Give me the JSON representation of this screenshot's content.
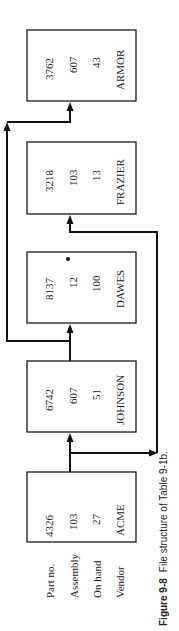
{
  "figure": {
    "caption_label": "Figure 9-8",
    "caption_text": "File structure of Table 9-1b.",
    "field_labels": [
      "Part no.",
      "Assembly",
      "On hand",
      "Vendor"
    ],
    "records": [
      {
        "part_no": "4326",
        "assembly": "103",
        "on_hand": "27",
        "vendor": "ACME"
      },
      {
        "part_no": "6742",
        "assembly": "607",
        "on_hand": "51",
        "vendor": "JOHNSON"
      },
      {
        "part_no": "8137",
        "assembly": "12",
        "on_hand": "100",
        "vendor": "DAWES",
        "marker": "•"
      },
      {
        "part_no": "3218",
        "assembly": "103",
        "on_hand": "13",
        "vendor": "FRAZIER"
      },
      {
        "part_no": "3762",
        "assembly": "607",
        "on_hand": "43",
        "vendor": "ARMOR"
      }
    ],
    "links": [
      {
        "from": "ACME",
        "to": "JOHNSON"
      },
      {
        "from": "ACME",
        "to": "FRAZIER"
      },
      {
        "from": "JOHNSON",
        "to": "DAWES"
      },
      {
        "from": "JOHNSON",
        "to": "ARMOR"
      }
    ]
  }
}
